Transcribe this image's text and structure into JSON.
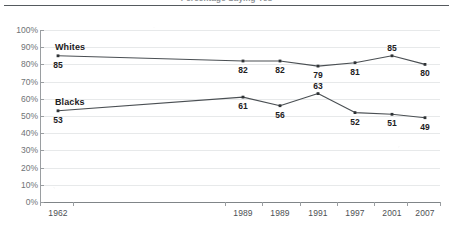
{
  "figure": {
    "clipped_heading": "Percentage Saying Yes",
    "background_color": "#ffffff",
    "line_color": "#4a4f53",
    "marker_color": "#2f3336",
    "grid_color": "#e7e9ea",
    "axis_color": "#9a9ea1",
    "label_color": "#6f7376"
  },
  "chart_data": {
    "type": "line",
    "title": "",
    "xlabel": "",
    "ylabel": "",
    "ylim": [
      0,
      100
    ],
    "grid": true,
    "legend": "inline-series-labels",
    "categories": [
      "1962",
      "1989",
      "1989",
      "1991",
      "1997",
      "2001",
      "2007"
    ],
    "series": [
      {
        "name": "Whites",
        "values": [
          85,
          82,
          82,
          79,
          81,
          85,
          80
        ]
      },
      {
        "name": "Blacks",
        "values": [
          53,
          61,
          56,
          63,
          52,
          51,
          49
        ]
      }
    ],
    "yticks": [
      "0%",
      "10%",
      "20%",
      "30%",
      "40%",
      "50%",
      "60%",
      "70%",
      "80%",
      "90%",
      "100%"
    ],
    "ytick_values": [
      0,
      10,
      20,
      30,
      40,
      50,
      60,
      70,
      80,
      90,
      100
    ],
    "point_x_positions": [
      58,
      243,
      280,
      318,
      355,
      392,
      425
    ],
    "whites_label_positions": [
      "below",
      "below",
      "below",
      "below",
      "below",
      "above",
      "below"
    ],
    "blacks_label_positions": [
      "below",
      "below",
      "below",
      "above",
      "below",
      "below",
      "below"
    ]
  }
}
